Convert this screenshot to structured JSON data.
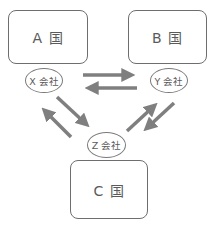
{
  "diagram": {
    "type": "trade-flow",
    "countries": [
      {
        "id": "A",
        "label": "A 国"
      },
      {
        "id": "B",
        "label": "B 国"
      },
      {
        "id": "C",
        "label": "C 国"
      }
    ],
    "companies": [
      {
        "id": "X",
        "label": "X 会社",
        "country": "A"
      },
      {
        "id": "Y",
        "label": "Y 会社",
        "country": "B"
      },
      {
        "id": "Z",
        "label": "Z 会社",
        "country": "C"
      }
    ],
    "flows": [
      {
        "from": "X",
        "to": "Y"
      },
      {
        "from": "Y",
        "to": "X"
      },
      {
        "from": "X",
        "to": "Z"
      },
      {
        "from": "Z",
        "to": "X"
      },
      {
        "from": "Z",
        "to": "Y"
      },
      {
        "from": "Y",
        "to": "Z"
      }
    ],
    "colors": {
      "arrow": "#7f7f7f",
      "border": "#6e6e6e",
      "text": "#5a5a5a",
      "background": "#ffffff"
    }
  }
}
